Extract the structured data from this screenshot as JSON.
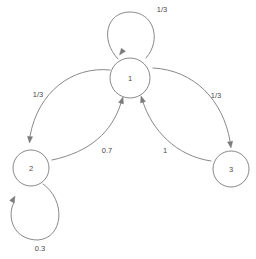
{
  "diagram": {
    "type": "state-transition-graph",
    "background_color": "#ffffff",
    "stroke_color": "#7a7a7a",
    "text_color": "#4a4a4a",
    "nodes": [
      {
        "id": "1",
        "label": "1",
        "cx": 130,
        "cy": 78,
        "r": 20
      },
      {
        "id": "2",
        "label": "2",
        "cx": 31,
        "cy": 168,
        "r": 18
      },
      {
        "id": "3",
        "label": "3",
        "cx": 231,
        "cy": 169,
        "r": 18
      }
    ],
    "edges": [
      {
        "id": "e-1-1",
        "from": "1",
        "to": "1",
        "label": "1/3",
        "kind": "self-loop",
        "label_x": 162,
        "label_y": 9,
        "path": "M 118 59 C 100 40 106 12 130 12 C 154 12 162 40 146 58",
        "arrow_x": 119.5,
        "arrow_y": 55,
        "arrow_angle": 127
      },
      {
        "id": "e-1-2",
        "from": "1",
        "to": "2",
        "label": "1/3",
        "kind": "curve",
        "label_x": 38,
        "label_y": 94,
        "path": "M 110 70 C 72 66 38 92 30 136",
        "arrow_x": 29.5,
        "arrow_y": 143,
        "arrow_angle": 95
      },
      {
        "id": "e-1-3",
        "from": "1",
        "to": "3",
        "label": "1/3",
        "kind": "curve",
        "label_x": 216,
        "label_y": 95,
        "path": "M 153 68 C 194 70 223 100 230 141",
        "arrow_x": 231,
        "arrow_y": 148,
        "arrow_angle": 82
      },
      {
        "id": "e-2-1",
        "from": "2",
        "to": "1",
        "label": "0.7",
        "kind": "curve",
        "label_x": 107,
        "label_y": 150,
        "path": "M 52 160 C 90 152 112 132 121 103",
        "arrow_x": 123,
        "arrow_y": 97,
        "arrow_angle": -72
      },
      {
        "id": "e-3-1",
        "from": "3",
        "to": "1",
        "label": "1",
        "kind": "curve",
        "label_x": 165,
        "label_y": 150,
        "path": "M 211 161 C 176 156 152 130 143 102",
        "arrow_x": 141,
        "arrow_y": 96,
        "arrow_angle": -108
      },
      {
        "id": "e-2-2",
        "from": "2",
        "to": "2",
        "label": "0.3",
        "kind": "self-loop",
        "label_x": 40,
        "label_y": 248,
        "path": "M 43 184 C 66 200 64 238 38 240 C 14 240 6 218 14 202",
        "arrow_x": 15,
        "arrow_y": 196,
        "arrow_angle": -62
      }
    ]
  }
}
